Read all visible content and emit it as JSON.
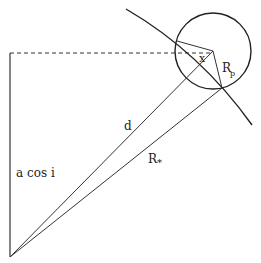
{
  "diagram": {
    "labels": {
      "a_cos_i": "a cos i",
      "d": "d",
      "r_star": "R",
      "r_star_sub": "*",
      "r_p": "R",
      "r_p_sub": "p",
      "x": "x"
    },
    "colors": {
      "line": "#333333",
      "background": "#ffffff"
    },
    "geometry": {
      "origin": [
        10,
        257
      ],
      "planet_center": [
        213,
        51
      ],
      "planet_radius": 38,
      "contact_point": [
        222,
        88
      ],
      "chord_point": [
        177,
        41
      ]
    }
  }
}
